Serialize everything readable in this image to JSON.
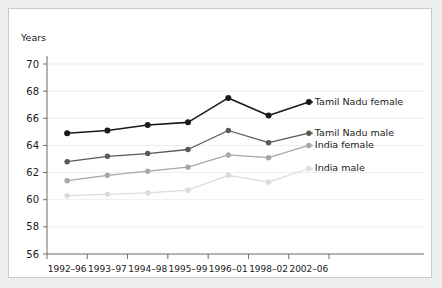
{
  "figure": {
    "background_color": "#ffffff",
    "page_background_color": "#efefef",
    "border_color": "#c9c9c9"
  },
  "chart_data": {
    "type": "line",
    "title": "",
    "subtitle": "",
    "xlabel": "",
    "ylabel": "Years",
    "ylim": [
      56,
      70
    ],
    "yticks": [
      56,
      58,
      60,
      62,
      64,
      66,
      68,
      70
    ],
    "grid": "horizontal",
    "legend_position": "right-inline-at-line-end",
    "categories": [
      "1992–96",
      "1993–97",
      "1994–98",
      "1995–99",
      "1996–01",
      "1998–02",
      "2002–06"
    ],
    "series": [
      {
        "name": "Tamil Nadu female",
        "color": "#1a1a1a",
        "values": [
          64.9,
          65.1,
          65.5,
          65.7,
          67.5,
          66.2,
          67.2
        ]
      },
      {
        "name": "Tamil Nadu male",
        "color": "#595959",
        "values": [
          62.8,
          63.2,
          63.4,
          63.7,
          65.1,
          64.2,
          64.9
        ]
      },
      {
        "name": "India female",
        "color": "#a8a8a8",
        "values": [
          61.4,
          61.8,
          62.1,
          62.4,
          63.3,
          63.1,
          64.0
        ]
      },
      {
        "name": "India male",
        "color": "#dcdcdc",
        "values": [
          60.3,
          60.4,
          60.5,
          60.7,
          61.8,
          61.3,
          62.3
        ]
      }
    ]
  }
}
